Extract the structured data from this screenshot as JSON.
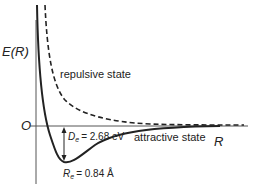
{
  "diagram": {
    "y_axis_label": "E(R)",
    "x_axis_label": "R",
    "origin_label": "O",
    "curves": [
      {
        "name": "repulsive state",
        "style": "dashed",
        "label": "repulsive state"
      },
      {
        "name": "attractive state",
        "style": "solid",
        "label": "attractive state"
      }
    ],
    "annotations": {
      "De": {
        "symbol": "D",
        "subscript": "e",
        "value": "= 2.68 eV"
      },
      "Re": {
        "symbol": "R",
        "subscript": "e",
        "value": "= 0.84 Å"
      }
    },
    "colors": {
      "line": "#222222",
      "background": "#ffffff"
    }
  }
}
